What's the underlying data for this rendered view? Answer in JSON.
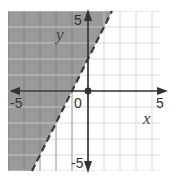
{
  "chart_data": {
    "type": "line",
    "title": "",
    "xlabel": "x",
    "ylabel": "y",
    "xlim": [
      -5,
      5
    ],
    "ylim": [
      -5,
      5
    ],
    "grid": true,
    "tick_labels": {
      "x": [
        "-5",
        "0",
        "5"
      ],
      "y": [
        "5",
        "-5"
      ]
    },
    "series": [
      {
        "name": "boundary",
        "equation": "y = 2x + 2",
        "style": "dashed",
        "slope": 2,
        "intercept": 2,
        "points": [
          [
            -3.5,
            -5
          ],
          [
            1.5,
            5
          ]
        ]
      }
    ],
    "shaded_region": {
      "inequality": "y > 2x + 2",
      "side": "left/above",
      "color": "#9a9a9a"
    },
    "points": [
      {
        "x": 0,
        "y": 0,
        "label": "origin"
      }
    ],
    "colors": {
      "shade": "#9a9a9a",
      "grid": "#d0d0d0",
      "grid_dark": "#7a7a7a",
      "axis": "#333333"
    }
  },
  "labels": {
    "x_axis": "x",
    "y_axis": "y",
    "x_min": "-5",
    "x_max": "5",
    "y_max": "5",
    "y_min": "-5",
    "origin": "0"
  }
}
